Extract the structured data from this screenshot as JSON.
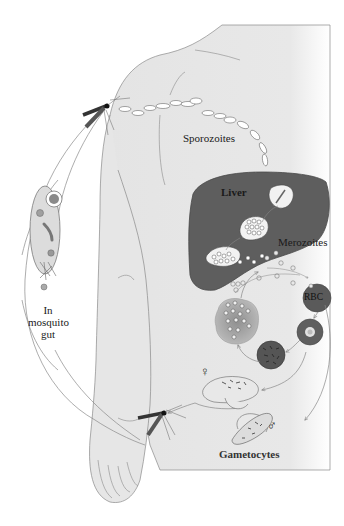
{
  "diagram": {
    "labels": {
      "sporozoites": "Sporozoites",
      "liver": "Liver",
      "merozoites": "Merozoites",
      "rbc": "RBC",
      "gametocytes": "Gametocytes",
      "mosquito_gut_line1": "In",
      "mosquito_gut_line2": "mosquito",
      "mosquito_gut_line3": "gut",
      "female_symbol": "♀",
      "male_symbol": "♂"
    },
    "colors": {
      "body_fill": "#e6e6e6",
      "liver_fill": "#5e5e5e",
      "rbc_fill": "#5a5a5a",
      "outline": "#777777",
      "background": "#ffffff"
    },
    "stages": [
      "Mosquito bite injects sporozoites",
      "Sporozoites travel to liver",
      "Liver stage releases merozoites",
      "Merozoites infect RBCs",
      "Ring stage",
      "Schizont",
      "Ruptured RBC releases merozoites",
      "Gametocytes (female and male)",
      "Mosquito bite takes up gametocytes",
      "Sexual stage in mosquito gut"
    ]
  }
}
